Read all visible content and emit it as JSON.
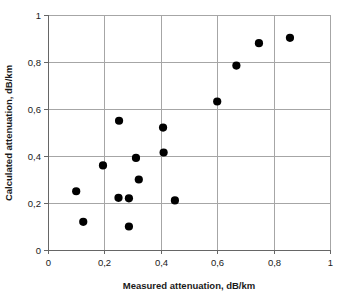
{
  "chart_data": {
    "type": "scatter",
    "title": "",
    "xlabel": "Measured attenuation, dB/km",
    "ylabel": "Calculated attenuation, dB/km",
    "xlim": [
      0,
      1
    ],
    "ylim": [
      0,
      1
    ],
    "grid": true,
    "legend": "none",
    "decimal_separator": ",",
    "xticks": [
      0,
      0.2,
      0.4,
      0.6,
      0.8,
      1
    ],
    "yticks": [
      0,
      0.2,
      0.4,
      0.6,
      0.8,
      1
    ],
    "xtick_labels": [
      "0",
      "0,2",
      "0,4",
      "0,6",
      "0,8",
      "1"
    ],
    "ytick_labels": [
      "0",
      "0,2",
      "0,4",
      "0,6",
      "0,8",
      "1"
    ],
    "marker": {
      "shape": "circle",
      "color": "#000000",
      "size_px": 4.1
    },
    "series": [
      {
        "name": "Attenuation comparison",
        "points": [
          {
            "x": 0.1,
            "y": 0.25
          },
          {
            "x": 0.125,
            "y": 0.12
          },
          {
            "x": 0.195,
            "y": 0.36
          },
          {
            "x": 0.252,
            "y": 0.55
          },
          {
            "x": 0.25,
            "y": 0.222
          },
          {
            "x": 0.287,
            "y": 0.22
          },
          {
            "x": 0.287,
            "y": 0.1
          },
          {
            "x": 0.312,
            "y": 0.392
          },
          {
            "x": 0.322,
            "y": 0.3
          },
          {
            "x": 0.408,
            "y": 0.521
          },
          {
            "x": 0.41,
            "y": 0.415
          },
          {
            "x": 0.45,
            "y": 0.211
          },
          {
            "x": 0.6,
            "y": 0.632
          },
          {
            "x": 0.668,
            "y": 0.785
          },
          {
            "x": 0.748,
            "y": 0.88
          },
          {
            "x": 0.858,
            "y": 0.903
          }
        ]
      }
    ],
    "n_points": 16
  },
  "plot_area": {
    "left": 48,
    "top": 15,
    "right": 330,
    "bottom": 250
  },
  "colors": {
    "marker": "#000000",
    "gridline": "#a6a6a6",
    "frame": "#8c8c8c",
    "text": "#1a1a1a",
    "background": "#ffffff"
  }
}
